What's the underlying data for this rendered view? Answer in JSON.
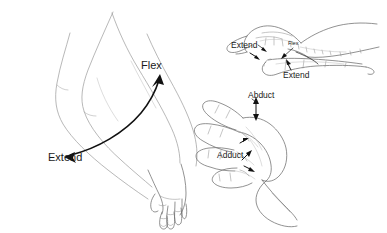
{
  "figure": {
    "background_color": "#ffffff",
    "width": 387,
    "height": 233,
    "line_color": "#6d6d6d",
    "arrow_color": "#111111",
    "text_color": "#1a1a1a"
  },
  "panels": {
    "arm": {
      "name": "forearm-and-wrist-lateral-view",
      "labels": {
        "flex": "Flex",
        "extend": "Extend"
      },
      "arrow": {
        "name": "wrist-flexion-extension-arrow",
        "style": "double-headed-curved"
      }
    },
    "hand_lateral": {
      "name": "hand-lateral-finger-flexion-view",
      "labels": {
        "extend_upper": "Extend",
        "flex": "Flex",
        "extend_lower": "Extend"
      }
    },
    "hand_palmar": {
      "name": "hand-palmar-abduction-adduction-view",
      "labels": {
        "abduct": "Abduct",
        "adduct": "Adduct"
      }
    }
  }
}
